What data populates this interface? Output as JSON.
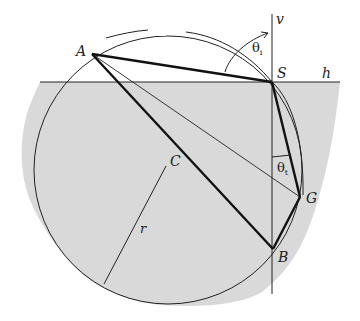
{
  "diagram": {
    "colors": {
      "region_fill": "#d9d9d9",
      "line": "#222222",
      "background": "#ffffff"
    },
    "points": {
      "A": {
        "label": "A",
        "x": 92,
        "y": 54
      },
      "S": {
        "label": "S",
        "x": 272,
        "y": 82
      },
      "G": {
        "label": "G",
        "x": 300,
        "y": 197
      },
      "B": {
        "label": "B",
        "x": 273,
        "y": 249
      },
      "C": {
        "label": "C",
        "x": 168,
        "y": 170
      }
    },
    "axes": {
      "vertical_label": "v",
      "horizontal_label": "h"
    },
    "angles": {
      "incident": {
        "symbol": "θ",
        "subscript": "i"
      },
      "transmitted": {
        "symbol": "θ",
        "subscript": "t"
      }
    },
    "radius_label": "r",
    "circle": {
      "cx": 168,
      "cy": 170,
      "r": 134
    }
  }
}
